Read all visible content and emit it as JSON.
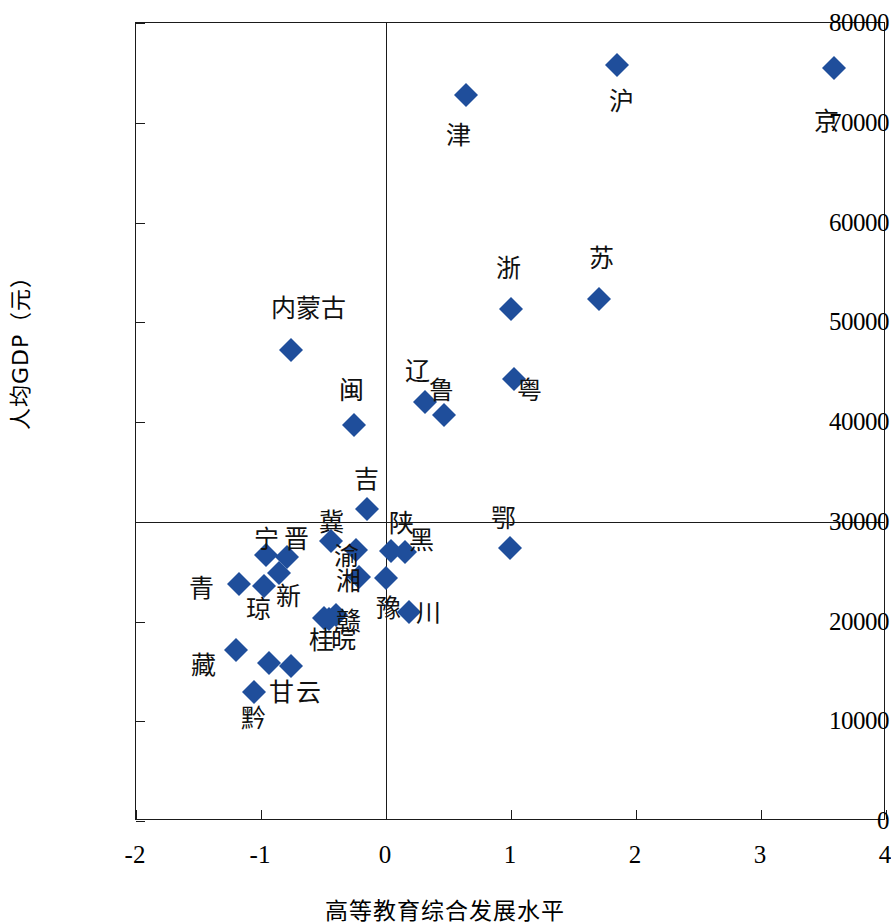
{
  "chart_data": {
    "type": "scatter",
    "title": "",
    "xlabel": "高等教育综合发展水平",
    "ylabel": "人均GDP（元）",
    "xlim": [
      -2,
      4
    ],
    "ylim": [
      0,
      80000
    ],
    "xticks": [
      "-2",
      "-1",
      "0",
      "1",
      "2",
      "3",
      "4"
    ],
    "xtick_values": [
      -2,
      -1,
      0,
      1,
      2,
      3,
      4
    ],
    "yticks": [
      "0",
      "10000",
      "20000",
      "30000",
      "40000",
      "50000",
      "60000",
      "70000",
      "80000"
    ],
    "ytick_values": [
      0,
      10000,
      20000,
      30000,
      40000,
      50000,
      60000,
      70000,
      80000
    ],
    "grid": false,
    "legend": null,
    "reference_lines": {
      "horizontal_y": 30000,
      "vertical_x": 0
    },
    "marker_color": "#1F4E9B",
    "marker_shape": "diamond",
    "points": [
      {
        "label": "京",
        "x": 3.58,
        "y": 75500,
        "lx": 3.52,
        "ly": 70200
      },
      {
        "label": "沪",
        "x": 1.85,
        "y": 75800,
        "lx": 1.88,
        "ly": 72200
      },
      {
        "label": "津",
        "x": 0.64,
        "y": 72800,
        "lx": 0.58,
        "ly": 68800
      },
      {
        "label": "苏",
        "x": 1.7,
        "y": 52300,
        "lx": 1.72,
        "ly": 56400
      },
      {
        "label": "浙",
        "x": 1.0,
        "y": 51300,
        "lx": 0.98,
        "ly": 55400
      },
      {
        "label": "内蒙古",
        "x": -0.76,
        "y": 47200,
        "lx": -0.62,
        "ly": 51400
      },
      {
        "label": "粤",
        "x": 1.02,
        "y": 44300,
        "lx": 1.15,
        "ly": 43200
      },
      {
        "label": "辽",
        "x": 0.31,
        "y": 42000,
        "lx": 0.25,
        "ly": 45100
      },
      {
        "label": "鲁",
        "x": 0.46,
        "y": 40700,
        "lx": 0.44,
        "ly": 43200
      },
      {
        "label": "闽",
        "x": -0.26,
        "y": 39700,
        "lx": -0.28,
        "ly": 43200
      },
      {
        "label": "吉",
        "x": -0.15,
        "y": 31300,
        "lx": -0.16,
        "ly": 34300
      },
      {
        "label": "冀",
        "x": -0.44,
        "y": 28100,
        "lx": -0.44,
        "ly": 30000
      },
      {
        "label": "陕",
        "x": 0.04,
        "y": 27100,
        "lx": 0.12,
        "ly": 29900
      },
      {
        "label": "黑",
        "x": 0.15,
        "y": 27000,
        "lx": 0.28,
        "ly": 28200
      },
      {
        "label": "鄂",
        "x": 0.99,
        "y": 27400,
        "lx": 0.94,
        "ly": 30400
      },
      {
        "label": "渝",
        "x": -0.24,
        "y": 27200,
        "lx": -0.32,
        "ly": 26600
      },
      {
        "label": "晋",
        "x": -0.79,
        "y": 26500,
        "lx": -0.72,
        "ly": 28300
      },
      {
        "label": "宁",
        "x": -0.96,
        "y": 26700,
        "lx": -0.96,
        "ly": 28300
      },
      {
        "label": "湘",
        "x": -0.22,
        "y": 24500,
        "lx": -0.3,
        "ly": 24100
      },
      {
        "label": "豫",
        "x": 0.0,
        "y": 24400,
        "lx": 0.02,
        "ly": 21400
      },
      {
        "label": "青",
        "x": -1.18,
        "y": 23800,
        "lx": -1.48,
        "ly": 23400
      },
      {
        "label": "琼",
        "x": -0.98,
        "y": 23600,
        "lx": -1.02,
        "ly": 21300
      },
      {
        "label": "新",
        "x": -0.86,
        "y": 24900,
        "lx": -0.78,
        "ly": 22600
      },
      {
        "label": "川",
        "x": 0.18,
        "y": 21000,
        "lx": 0.34,
        "ly": 20900
      },
      {
        "label": "赣",
        "x": -0.4,
        "y": 20700,
        "lx": -0.3,
        "ly": 20100
      },
      {
        "label": "皖",
        "x": -0.46,
        "y": 20300,
        "lx": -0.34,
        "ly": 18200
      },
      {
        "label": "桂",
        "x": -0.5,
        "y": 20400,
        "lx": -0.52,
        "ly": 18100
      },
      {
        "label": "藏",
        "x": -1.2,
        "y": 17100,
        "lx": -1.46,
        "ly": 15600
      },
      {
        "label": "甘",
        "x": -0.94,
        "y": 15800,
        "lx": -0.84,
        "ly": 12900
      },
      {
        "label": "云",
        "x": -0.76,
        "y": 15500,
        "lx": -0.62,
        "ly": 12900
      },
      {
        "label": "黔",
        "x": -1.06,
        "y": 12900,
        "lx": -1.06,
        "ly": 10300
      }
    ]
  }
}
